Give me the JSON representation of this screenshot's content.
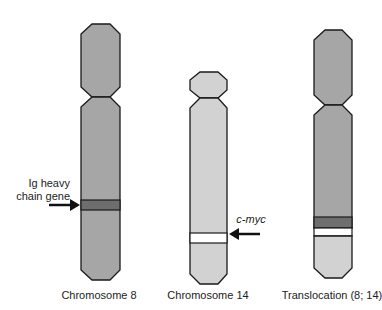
{
  "figure": {
    "title": "",
    "colors": {
      "chr8": "#a6a6a6",
      "chr14": "#d2d2d2",
      "band_dark": "#6e6e6e",
      "band_white": "#ffffff",
      "outline": "#1a1a1a",
      "text": "#222222"
    },
    "chromosomes": [
      {
        "id": "chr8",
        "label": "Chromosome 8"
      },
      {
        "id": "chr14",
        "label": "Chromosome 14"
      },
      {
        "id": "translocation",
        "label": "Translocation (8; 14)"
      }
    ],
    "annotations": [
      {
        "id": "ig-heavy",
        "lines": [
          "Ig heavy",
          "chain gene"
        ],
        "target": "chr8",
        "icon": "arrow-right-icon"
      },
      {
        "id": "c-myc",
        "text": "c-myc",
        "target": "chr14",
        "icon": "arrow-left-icon"
      }
    ]
  }
}
